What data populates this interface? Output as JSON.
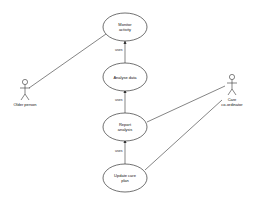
{
  "diagram": {
    "type": "use-case",
    "actors": [
      {
        "id": "older",
        "label": "Older person"
      },
      {
        "id": "coord",
        "label_line1": "Care",
        "label_line2": "co-ordinator"
      }
    ],
    "use_cases": [
      {
        "id": "monitor",
        "line1": "Monitor",
        "line2": "activity"
      },
      {
        "id": "analyse",
        "line1": "Analyse data",
        "line2": ""
      },
      {
        "id": "report",
        "line1": "Report",
        "line2": "analysis"
      },
      {
        "id": "update",
        "line1": "Update care",
        "line2": "plan"
      }
    ],
    "relations": [
      {
        "from": "analyse",
        "to": "monitor",
        "label": "uses"
      },
      {
        "from": "report",
        "to": "analyse",
        "label": "uses"
      },
      {
        "from": "update",
        "to": "report",
        "label": "uses"
      }
    ],
    "associations": [
      {
        "actor": "older",
        "use_case": "monitor"
      },
      {
        "actor": "coord",
        "use_case": "report"
      },
      {
        "actor": "coord",
        "use_case": "update"
      }
    ],
    "colors": {
      "line": "#333333",
      "background": "#ffffff"
    }
  }
}
